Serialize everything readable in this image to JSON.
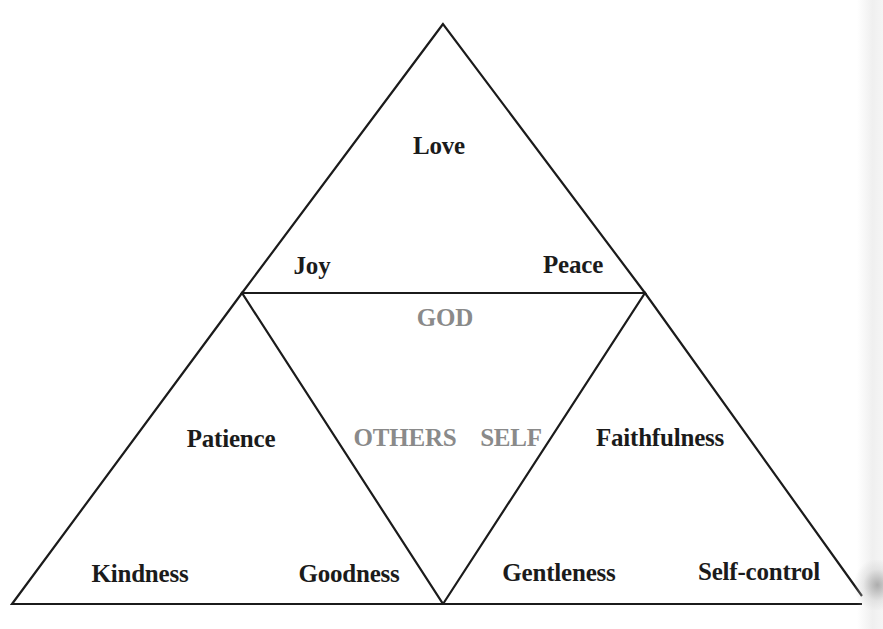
{
  "diagram": {
    "type": "triangle-of-triangles",
    "colors": {
      "line": "#1b1b1b",
      "virtue_text": "#1b1b1b",
      "relation_text": "#8a8a8a",
      "background": "#ffffff"
    },
    "top_triangle": {
      "labels": {
        "apex": "Love",
        "left": "Joy",
        "right": "Peace"
      }
    },
    "center_triangle": {
      "labels": {
        "top": "GOD",
        "left": "OTHERS",
        "right": "SELF"
      }
    },
    "left_triangle": {
      "labels": {
        "apex": "Patience",
        "left": "Kindness",
        "right": "Goodness"
      }
    },
    "right_triangle": {
      "labels": {
        "apex": "Faithfulness",
        "left": "Gentleness",
        "right": "Self-control"
      }
    }
  }
}
